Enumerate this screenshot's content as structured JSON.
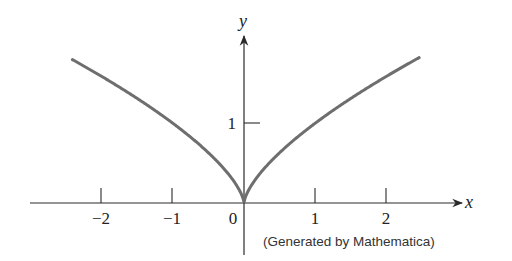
{
  "chart_data": {
    "type": "line",
    "title": "",
    "function": "y = x^(2/3)",
    "xlabel": "x",
    "ylabel": "y",
    "xlim": [
      -2.4,
      2.45
    ],
    "ylim": [
      0,
      1.85
    ],
    "grid": false,
    "legend": null,
    "x_ticks": [
      -2,
      -1,
      0,
      1,
      2
    ],
    "x_tick_labels": [
      "−2",
      "−1",
      "0",
      "1",
      "2"
    ],
    "y_ticks": [
      1
    ],
    "y_tick_labels": [
      "1"
    ],
    "series": [
      {
        "name": "x^(2/3)",
        "x": [
          -2.4,
          -2.0,
          -1.5,
          -1.0,
          -0.5,
          -0.25,
          -0.1,
          0,
          0.1,
          0.25,
          0.5,
          1.0,
          1.5,
          2.0,
          2.45
        ],
        "y": [
          1.79,
          1.59,
          1.31,
          1.0,
          0.63,
          0.4,
          0.22,
          0,
          0.22,
          0.4,
          0.63,
          1.0,
          1.31,
          1.59,
          1.82
        ]
      }
    ],
    "annotations": [
      "(Generated by Mathematica)"
    ],
    "colors": {
      "curve": "#6e6e6e",
      "axes": "#2a2a2a"
    }
  },
  "labels": {
    "x_axis": "x",
    "y_axis": "y",
    "ticks_x": [
      "−2",
      "−1",
      "0",
      "1",
      "2"
    ],
    "tick_y1": "1",
    "credit": "(Generated by Mathematica)"
  }
}
